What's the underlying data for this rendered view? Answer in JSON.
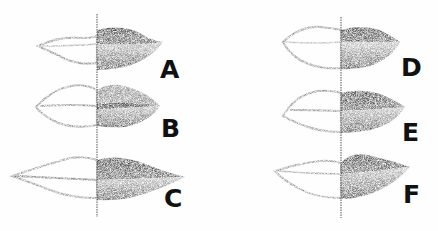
{
  "figure": {
    "colors": {
      "ink": "#111111",
      "shade_dark": "#1a1a1a",
      "shade_mid": "#6a6a6a",
      "outline": "#8a8a8a",
      "paper": "#fefefe"
    },
    "items": [
      {
        "label": "A",
        "type": "thin upper lip, full lower lip"
      },
      {
        "label": "B",
        "type": "full lips"
      },
      {
        "label": "C",
        "type": "wide lips"
      },
      {
        "label": "D",
        "type": "medium lips"
      },
      {
        "label": "E",
        "type": "upturned corners"
      },
      {
        "label": "F",
        "type": "full upper lip, thin lower lip"
      }
    ]
  }
}
